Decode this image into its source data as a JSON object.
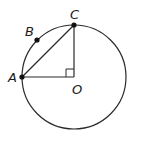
{
  "diagram": {
    "type": "circle-geometry",
    "circle": {
      "center": "O",
      "cx": 74,
      "cy": 77,
      "r": 52
    },
    "points": [
      {
        "name": "A",
        "label": "A",
        "x": 22,
        "y": 77,
        "dot": true
      },
      {
        "name": "B",
        "label": "B",
        "x": 37,
        "y": 40,
        "dot": true
      },
      {
        "name": "C",
        "label": "C",
        "x": 74,
        "y": 25,
        "dot": true
      },
      {
        "name": "O",
        "label": "O",
        "x": 74,
        "y": 77,
        "dot": false
      }
    ],
    "segments": [
      [
        "A",
        "C"
      ],
      [
        "C",
        "O"
      ],
      [
        "A",
        "O"
      ]
    ],
    "right_angle_at": "O",
    "colors": {
      "stroke": "#2a2a2a",
      "background": "#ffffff"
    }
  }
}
